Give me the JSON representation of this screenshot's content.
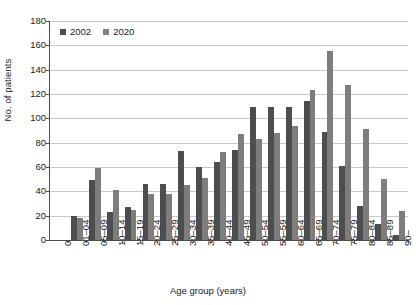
{
  "chart_data": {
    "type": "bar",
    "title": "",
    "xlabel": "Age group (years)",
    "ylabel": "No. of patients",
    "ylim": [
      0,
      180
    ],
    "ytick_step": 20,
    "yticks": [
      0,
      20,
      40,
      60,
      80,
      100,
      120,
      140,
      160,
      180
    ],
    "grid": true,
    "legend_position": "top-left",
    "origin_tick_label": "0",
    "categories": [
      "01–04",
      "05–09",
      "10–14",
      "15–19",
      "20–24",
      "25–29",
      "30–34",
      "35–39",
      "40–44",
      "45–49",
      "50–54",
      "55–59",
      "60–64",
      "65–69",
      "70–74",
      "75–79",
      "80–84",
      "85–89",
      "90–"
    ],
    "series": [
      {
        "name": "2002",
        "color": "#4d4d4d",
        "values": [
          20,
          49,
          23,
          27,
          46,
          46,
          73,
          60,
          64,
          74,
          109,
          109,
          109,
          114,
          89,
          61,
          28,
          13,
          4
        ]
      },
      {
        "name": "2020",
        "color": "#7d7d7d",
        "values": [
          18,
          59,
          41,
          25,
          38,
          38,
          45,
          51,
          72,
          87,
          83,
          88,
          94,
          123,
          155,
          127,
          91,
          50,
          24
        ]
      }
    ]
  },
  "colors": {
    "axis": "#4d4d4d",
    "grid": "#c9c9c9",
    "text": "#1a1a1a",
    "background": "#ffffff",
    "series_2002": "#4d4d4d",
    "series_2020": "#7d7d7d"
  }
}
